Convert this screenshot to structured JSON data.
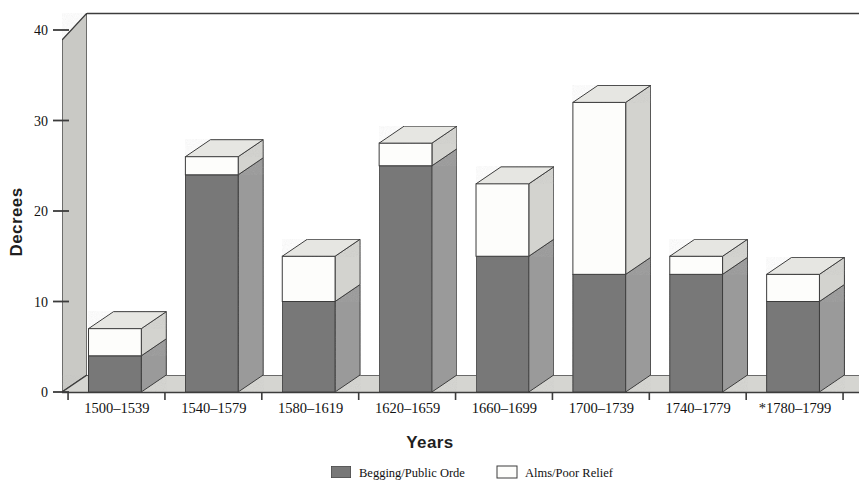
{
  "chart_data": {
    "type": "bar",
    "subtype": "stacked-3d-column",
    "title": "",
    "xlabel": "Years",
    "ylabel": "Decrees",
    "ylim": [
      0,
      42
    ],
    "yticks": [
      0,
      10,
      20,
      30,
      40
    ],
    "ytick_labels": [
      "0",
      "10",
      "20",
      "30",
      "40"
    ],
    "grid": false,
    "legend_position": "bottom",
    "categories": [
      "1500–1539",
      "1540–1579",
      "1580–1619",
      "1620–1659",
      "1660–1699",
      "1700–1739",
      "1740–1779",
      "*1780–1799"
    ],
    "series": [
      {
        "name": "Begging/Public Orde",
        "color": "#787878",
        "values": [
          4,
          24,
          10,
          25,
          15,
          13,
          13,
          10
        ]
      },
      {
        "name": "Alms/Poor Relief",
        "color": "#fdfdfb",
        "values": [
          3,
          2,
          5,
          2.5,
          8,
          19,
          2,
          3
        ]
      }
    ],
    "totals": [
      7,
      26,
      15,
      27.5,
      23,
      32,
      15,
      13
    ],
    "footnote_marker": "*"
  },
  "axes": {
    "y_title": "Decrees",
    "x_title": "Years"
  },
  "legend": {
    "items": [
      {
        "label": "Begging/Public Orde",
        "swatch": "dark-gray"
      },
      {
        "label": "Alms/Poor Relief",
        "swatch": "white"
      }
    ]
  },
  "colors": {
    "bar_front_dark": "#787878",
    "bar_side_dark": "#9a9a9a",
    "bar_front_light": "#fdfdfb",
    "bar_side_light": "#d3d3cf",
    "bar_top_light": "#e6e6e2",
    "wall_left": "#c9c9c5",
    "floor": "#d5d5d1",
    "outline": "#3c3c3c",
    "text": "#111111"
  }
}
